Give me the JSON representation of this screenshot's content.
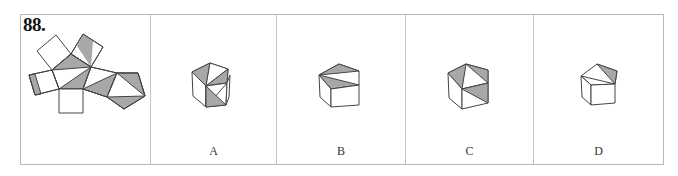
{
  "question": {
    "number": "88.",
    "type": "cube-net folding puzzle",
    "net_description": "Central pentagon with squares on each side and a pentagon attached; several faces have grey shaded triangles"
  },
  "options": [
    {
      "label": "A",
      "figure": "pentagonal-prism-option-a"
    },
    {
      "label": "B",
      "figure": "pentagonal-prism-option-b"
    },
    {
      "label": "C",
      "figure": "pentagonal-prism-option-c"
    },
    {
      "label": "D",
      "figure": "pentagonal-prism-option-d"
    }
  ],
  "colors": {
    "shade": "#a8a8a8",
    "stroke": "#444444",
    "border": "#b8b8b8"
  }
}
